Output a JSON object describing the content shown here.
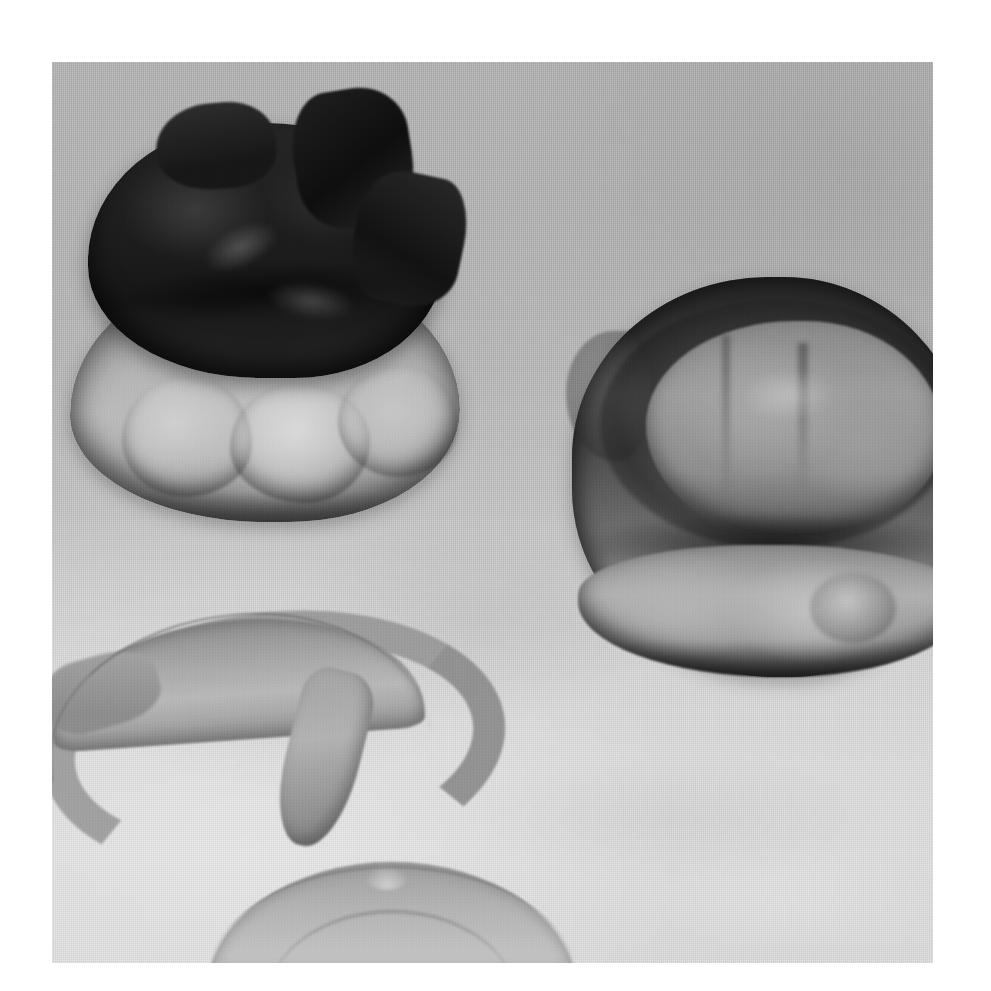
{
  "page": {
    "background_color": "#ffffff",
    "width": 991,
    "height": 991
  },
  "photo": {
    "kind": "gross-pathology-specimen-photograph",
    "color_mode": "grayscale",
    "caption": "",
    "backdrop": {
      "description": "gray woven cloth drape",
      "color_top": "#b0b0b0",
      "color_bottom": "#dedede"
    },
    "frame": {
      "left": 52,
      "top": 62,
      "width": 881,
      "height": 901
    }
  },
  "specimens": [
    {
      "id": "mass-left",
      "label": "Upper-left resected mass with dark hemorrhagic surface",
      "position": "upper left",
      "surface_color": "#1c1c1c",
      "body_color": "#b6b6b6",
      "notes": "Lobulated pale inferior body capped by ragged near-black necrotic/hemorrhagic tissue"
    },
    {
      "id": "mass-right",
      "label": "Right rounded mass with concentric zones",
      "position": "right",
      "surface_color": "#3a3a3a",
      "body_color": "#a9a9a9",
      "notes": "Disc-shaped specimen showing a dark outer rim, mid-gray ring and lighter central core; partly cropped at the right photo edge"
    },
    {
      "id": "tube-upper",
      "label": "Upper arc-shaped tubular structure",
      "position": "lower left",
      "surface_color": "#a8a8a8",
      "notes": "Curved, inverted-U tubular segment with a downward-pointing blind end on the right"
    },
    {
      "id": "tube-lower",
      "label": "Lower arc-shaped tubular structure",
      "position": "bottom center",
      "surface_color": "#b4b4b4",
      "notes": "Second curved tubular segment, cropped by the lower photo edge"
    }
  ]
}
